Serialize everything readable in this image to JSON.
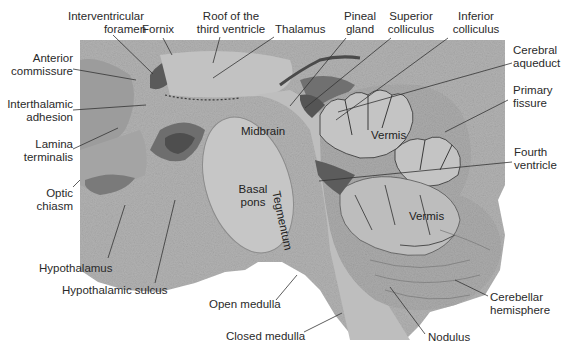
{
  "figure": {
    "type": "anatomical-photograph",
    "colors": {
      "background": "#ffffff",
      "tissue": "#b4b4b4",
      "tissue_dark": "#8a8a8a",
      "leader_line": "#333333",
      "label_text": "#2a2a2a"
    }
  },
  "labels": {
    "interventricular_foramen": {
      "line1": "Interventricular",
      "line2": "foramen"
    },
    "fornix": {
      "line1": "Fornix"
    },
    "roof_third_ventricle": {
      "line1": "Roof of the",
      "line2": "third ventricle"
    },
    "thalamus": {
      "line1": "Thalamus"
    },
    "pineal_gland": {
      "line1": "Pineal",
      "line2": "gland"
    },
    "superior_colliculus": {
      "line1": "Superior",
      "line2": "colliculus"
    },
    "inferior_colliculus": {
      "line1": "Inferior",
      "line2": "colliculus"
    },
    "cerebral_aqueduct": {
      "line1": "Cerebral",
      "line2": "aqueduct"
    },
    "primary_fissure": {
      "line1": "Primary",
      "line2": "fissure"
    },
    "fourth_ventricle": {
      "line1": "Fourth",
      "line2": "ventricle"
    },
    "anterior_commissure": {
      "line1": "Anterior",
      "line2": "commissure"
    },
    "interthalamic_adhesion": {
      "line1": "Interthalamic",
      "line2": "adhesion"
    },
    "lamina_terminalis": {
      "line1": "Lamina",
      "line2": "terminalis"
    },
    "optic_chiasm": {
      "line1": "Optic",
      "line2": "chiasm"
    },
    "hypothalamus": {
      "line1": "Hypothalamus"
    },
    "hypothalamic_sulcus": {
      "line1": "Hypothalamic sulcus"
    },
    "open_medulla": {
      "line1": "Open medulla"
    },
    "closed_medulla": {
      "line1": "Closed medulla"
    },
    "nodulus": {
      "line1": "Nodulus"
    },
    "cerebellar_hemisphere": {
      "line1": "Cerebellar",
      "line2": "hemisphere"
    }
  },
  "inner_labels": {
    "midbrain": "Midbrain",
    "tegmentum": "Tegmentum",
    "basal_pons": {
      "line1": "Basal",
      "line2": "pons"
    },
    "vermis_upper": "Vermis",
    "vermis_lower": "Vermis"
  }
}
